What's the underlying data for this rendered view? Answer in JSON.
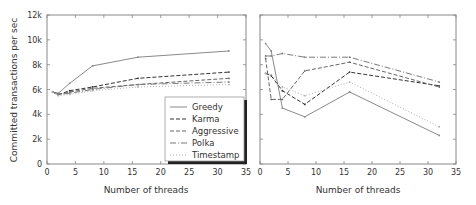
{
  "chart_data": [
    {
      "type": "line",
      "title": "",
      "xlabel": "Number of threads",
      "ylabel": "Committed transactions per sec",
      "xlim": [
        0,
        35
      ],
      "ylim": [
        0,
        12000
      ],
      "x_ticks": [
        "0",
        "5",
        "10",
        "15",
        "20",
        "25",
        "30",
        "35"
      ],
      "y_ticks": [
        "0",
        "2k",
        "4k",
        "6k",
        "8k",
        "10k",
        "12k"
      ],
      "grid": false,
      "legend_position": "lower right",
      "x": [
        1,
        2,
        4,
        8,
        16,
        32
      ],
      "series": [
        {
          "name": "Greedy",
          "values": [
            5800,
            5700,
            6500,
            7900,
            8600,
            9100
          ]
        },
        {
          "name": "Karma",
          "values": [
            5800,
            5600,
            5900,
            6200,
            6900,
            7400
          ]
        },
        {
          "name": "Aggressive",
          "values": [
            5800,
            5600,
            5800,
            6100,
            6400,
            6900
          ]
        },
        {
          "name": "Polka",
          "values": [
            5800,
            5600,
            5700,
            6000,
            6400,
            6600
          ]
        },
        {
          "name": "Timestamp",
          "values": [
            5800,
            5500,
            5600,
            5900,
            6200,
            6400
          ]
        }
      ]
    },
    {
      "type": "line",
      "title": "",
      "xlabel": "Number of threads",
      "ylabel": "",
      "xlim": [
        0,
        35
      ],
      "ylim": [
        0,
        12000
      ],
      "x_ticks": [
        "0",
        "5",
        "10",
        "15",
        "20",
        "25",
        "30",
        "35"
      ],
      "y_ticks": [],
      "grid": false,
      "x": [
        1,
        2,
        4,
        8,
        16,
        32
      ],
      "series": [
        {
          "name": "Greedy",
          "values": [
            9700,
            9100,
            4500,
            3800,
            5800,
            2300
          ]
        },
        {
          "name": "Karma",
          "values": [
            7300,
            7100,
            5900,
            4800,
            7400,
            6300
          ]
        },
        {
          "name": "Aggressive",
          "values": [
            8500,
            5200,
            5200,
            7500,
            8200,
            6200
          ]
        },
        {
          "name": "Polka",
          "values": [
            8700,
            8700,
            8900,
            8600,
            8600,
            6600
          ]
        },
        {
          "name": "Timestamp",
          "values": [
            7300,
            7200,
            6200,
            5500,
            6600,
            3000
          ]
        }
      ]
    }
  ],
  "styles": {
    "Greedy": {
      "color": "#8a8a8a",
      "dash": ""
    },
    "Karma": {
      "color": "#333333",
      "dash": "4,2"
    },
    "Aggressive": {
      "color": "#666666",
      "dash": "4,2"
    },
    "Polka": {
      "color": "#7a7a7a",
      "dash": "6,2,1,2"
    },
    "Timestamp": {
      "color": "#b0b0b0",
      "dash": "1,2"
    }
  }
}
